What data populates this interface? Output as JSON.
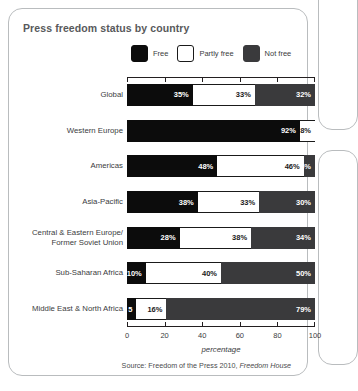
{
  "chart_title": "Press freedom status by country",
  "legend": {
    "items": [
      {
        "label": "Free",
        "color": "#0c0c0c",
        "icon": "legend-swatch-free"
      },
      {
        "label": "Partly free",
        "color": "#ffffff",
        "icon": "legend-swatch-partly-free"
      },
      {
        "label": "Not free",
        "color": "#3a3a3c",
        "icon": "legend-swatch-not-free"
      }
    ]
  },
  "axis": {
    "x_title": "percentage",
    "x_ticks": [
      "0",
      "20",
      "40",
      "60",
      "80",
      "100"
    ]
  },
  "source": {
    "prefix": "Source: Freedom of the Press 2010, ",
    "italic": "Freedom House"
  },
  "chart_data": {
    "type": "bar",
    "orientation": "horizontal",
    "stacked": true,
    "stacked_total": 100,
    "title": "Press freedom status by country",
    "xlabel": "percentage",
    "ylabel": "",
    "xlim": [
      0,
      100
    ],
    "xticks": [
      0,
      20,
      40,
      60,
      80,
      100
    ],
    "grid": false,
    "legend_position": "top",
    "categories": [
      "Global",
      "Western Europe",
      "Americas",
      "Asia-Pacific",
      "Central & Eastern Europe/\nFormer Soviet Union",
      "Sub-Saharan Africa",
      "Middle East & North Africa"
    ],
    "series": [
      {
        "name": "Free",
        "color": "#0c0c0c",
        "values": [
          35,
          92,
          48,
          38,
          28,
          10,
          5
        ]
      },
      {
        "name": "Partly free",
        "color": "#ffffff",
        "values": [
          33,
          8,
          46,
          33,
          38,
          40,
          16
        ]
      },
      {
        "name": "Not free",
        "color": "#3a3a3c",
        "values": [
          32,
          0,
          6,
          30,
          34,
          50,
          79
        ]
      }
    ],
    "data_labels": [
      {
        "category": "Global",
        "labels": [
          "35%",
          "33%",
          "32%"
        ]
      },
      {
        "category": "Western Europe",
        "labels": [
          "92%",
          "8%",
          ""
        ]
      },
      {
        "category": "Americas",
        "labels": [
          "48%",
          "46%",
          "6%"
        ]
      },
      {
        "category": "Asia-Pacific",
        "labels": [
          "38%",
          "33%",
          "30%"
        ]
      },
      {
        "category": "Central & Eastern Europe/Former Soviet Union",
        "labels": [
          "28%",
          "38%",
          "34%"
        ]
      },
      {
        "category": "Sub-Saharan Africa",
        "labels": [
          "10%",
          "40%",
          "50%"
        ]
      },
      {
        "category": "Middle East & North Africa",
        "labels": [
          "5",
          "16%",
          "79%"
        ]
      }
    ],
    "source": "Source: Freedom of the Press 2010, Freedom House"
  }
}
